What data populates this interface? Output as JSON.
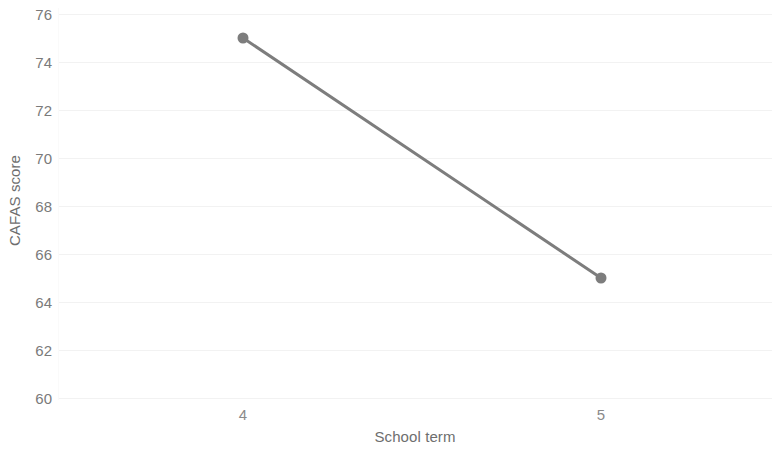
{
  "chart_data": {
    "type": "line",
    "title": "",
    "subtitle": "",
    "xlabel": "School term",
    "ylabel": "CAFAS score",
    "categories": [
      "4",
      "5"
    ],
    "x": [
      4,
      5
    ],
    "values": [
      75,
      65
    ],
    "series": [
      {
        "name": "CAFAS score",
        "values": [
          75,
          65
        ]
      }
    ],
    "ylim": [
      60,
      76
    ],
    "ytick_labels": [
      "60",
      "62",
      "64",
      "66",
      "68",
      "70",
      "72",
      "74",
      "76"
    ],
    "ytick_values": [
      60,
      62,
      64,
      66,
      68,
      70,
      72,
      74,
      76
    ],
    "xtick_labels": [
      "4",
      "5"
    ],
    "grid": "horizontal-only",
    "legend": "none",
    "markers": "filled-circle",
    "colors": {
      "line": "#7d7d7d",
      "marker": "#7d7d7d",
      "gridline": "#f2f2f2",
      "tick_label": "#7a7a7a",
      "axis_title": "#6e6e6e",
      "background": "#ffffff"
    }
  }
}
